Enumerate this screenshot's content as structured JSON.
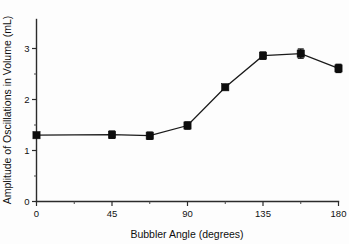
{
  "chart_data": {
    "type": "line",
    "title": "",
    "subtitle": "",
    "xlabel": "Bubbler Angle (degrees)",
    "ylabel": "Amplitude of Oscillations in Volume (mL)",
    "xlim": [
      0,
      180
    ],
    "ylim": [
      0,
      3.3
    ],
    "grid": false,
    "legend": null,
    "legend_position": "none",
    "marker": "filled-square",
    "line_color": "#1a1a1a",
    "marker_color": "#0d0d0d",
    "error_bars": "vertical-with-caps",
    "x_ticks_major": [
      0,
      45,
      90,
      135,
      180
    ],
    "x_tick_labels": [
      "0",
      "45",
      "90",
      "135",
      "180"
    ],
    "x_ticks_minor": [
      22.5,
      67.5,
      112.5,
      157.5
    ],
    "y_ticks_major": [
      0,
      1,
      2,
      3
    ],
    "y_tick_labels": [
      "0",
      "1",
      "2",
      "3"
    ],
    "y_ticks_minor": [
      0.5,
      1.5,
      2.5
    ],
    "x": [
      0,
      45,
      67.5,
      90,
      112.5,
      135,
      157.5,
      180
    ],
    "values": [
      1.3,
      1.31,
      1.29,
      1.49,
      2.24,
      2.86,
      2.9,
      2.61
    ],
    "errors": [
      0.04,
      0.07,
      0.07,
      0.07,
      0.04,
      0.07,
      0.09,
      0.08
    ],
    "series": [
      {
        "name": "Amplitude of Oscillations in Volume",
        "x": [
          0,
          45,
          67.5,
          90,
          112.5,
          135,
          157.5,
          180
        ],
        "values": [
          1.3,
          1.31,
          1.29,
          1.49,
          2.24,
          2.86,
          2.9,
          2.61
        ],
        "errors": [
          0.04,
          0.07,
          0.07,
          0.07,
          0.04,
          0.07,
          0.09,
          0.08
        ]
      }
    ]
  },
  "axes": {
    "x_title": "Bubbler Angle (degrees)",
    "y_title": "Amplitude of Oscillations in Volume (mL)",
    "x_labels": [
      "0",
      "45",
      "90",
      "135",
      "180"
    ],
    "y_labels": [
      "0",
      "1",
      "2",
      "3"
    ]
  }
}
